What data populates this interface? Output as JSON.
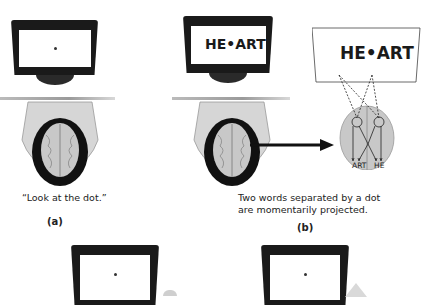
{
  "panel_a": {
    "screen_content": "•",
    "caption": "“Look at the dot.”",
    "label": "(a)"
  },
  "panel_b": {
    "screen_text": "HE•ART",
    "projection_text": "HE•ART",
    "left_hemisphere_word": "ART",
    "right_hemisphere_word": "HE",
    "caption_line1": "Two words separated by a dot",
    "caption_line2": "are momentarily projected.",
    "label": "(b)"
  },
  "panel_c": {
    "screen_content": "•"
  },
  "panel_d": {
    "screen_content": "•"
  },
  "colors": {
    "monitor": "#1a1a1a",
    "brain": "#c8c8c8",
    "hair": "#111111",
    "arrow": "#111111",
    "text": "#222222"
  }
}
